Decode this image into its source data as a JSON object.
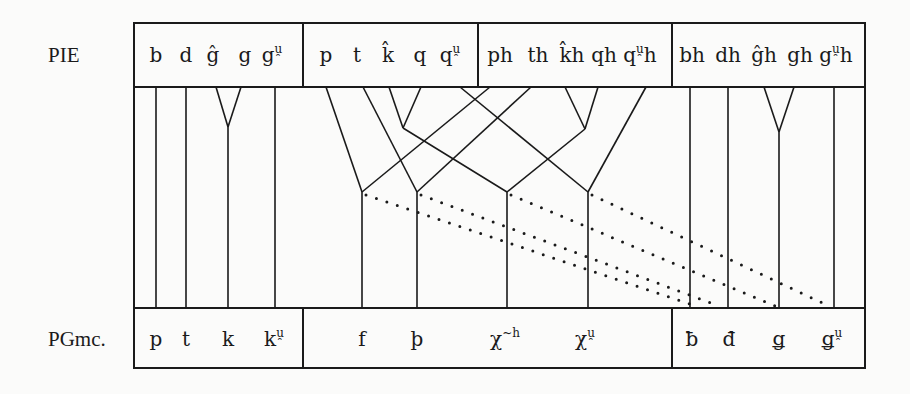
{
  "rows": {
    "top_label": "PIE",
    "bottom_label": "PGmc."
  },
  "pie": {
    "groups": [
      {
        "name": "voiced",
        "items": [
          {
            "base": "b",
            "sup": "",
            "x": 156
          },
          {
            "base": "d",
            "sup": "",
            "x": 186
          },
          {
            "base": "ĝ",
            "sup": "",
            "x": 213
          },
          {
            "base": "g",
            "sup": "",
            "x": 245
          },
          {
            "base": "g",
            "sup": "u̯",
            "x": 272
          }
        ]
      },
      {
        "name": "voiceless",
        "items": [
          {
            "base": "p",
            "sup": "",
            "x": 326
          },
          {
            "base": "t",
            "sup": "",
            "x": 357
          },
          {
            "base": "k̂",
            "sup": "",
            "x": 388
          },
          {
            "base": "q",
            "sup": "",
            "x": 420
          },
          {
            "base": "q",
            "sup": "u̯",
            "x": 450
          }
        ]
      },
      {
        "name": "voiceless-aspirate",
        "items": [
          {
            "base": "ph",
            "sup": "",
            "x": 500
          },
          {
            "base": "th",
            "sup": "",
            "x": 538
          },
          {
            "base": "k̂h",
            "sup": "",
            "x": 572
          },
          {
            "base": "qh",
            "sup": "",
            "x": 604
          },
          {
            "base": "q",
            "sup": "u̯",
            "tail": "h",
            "x": 640
          }
        ]
      },
      {
        "name": "voiced-aspirate",
        "items": [
          {
            "base": "bh",
            "sup": "",
            "x": 692
          },
          {
            "base": "dh",
            "sup": "",
            "x": 728
          },
          {
            "base": "ĝh",
            "sup": "",
            "x": 764
          },
          {
            "base": "gh",
            "sup": "",
            "x": 800
          },
          {
            "base": "g",
            "sup": "u̯",
            "tail": "h",
            "x": 836
          }
        ]
      }
    ]
  },
  "pgmc": {
    "groups": [
      {
        "name": "voiceless-stops",
        "items": [
          {
            "base": "p",
            "sup": "",
            "x": 156
          },
          {
            "base": "t",
            "sup": "",
            "x": 186
          },
          {
            "base": "k",
            "sup": "",
            "x": 228
          },
          {
            "base": "k",
            "sup": "u̯",
            "x": 274
          }
        ]
      },
      {
        "name": "voiceless-fricatives",
        "items": [
          {
            "base": "f",
            "sup": "",
            "x": 362
          },
          {
            "base": "þ",
            "sup": "",
            "x": 417
          },
          {
            "base": "χ",
            "sup": "~h",
            "x": 505
          },
          {
            "base": "χ",
            "sup": "u̯",
            "x": 585
          }
        ]
      },
      {
        "name": "voiced-fricatives",
        "items": [
          {
            "base": "ƀ",
            "sup": "",
            "x": 692
          },
          {
            "base": "đ",
            "sup": "",
            "x": 729
          },
          {
            "base": "ǥ",
            "sup": "",
            "x": 779
          },
          {
            "base": "ǥ",
            "sup": "u̯",
            "x": 832
          }
        ]
      }
    ]
  },
  "layout": {
    "frame": {
      "left": 134,
      "right": 865,
      "top": 23,
      "header_bottom": 87,
      "footer_top": 308,
      "bottom": 368
    },
    "top_dividers": [
      303,
      478,
      672
    ],
    "bottom_dividers": [
      303,
      672
    ]
  },
  "edges": {
    "solid": [
      [
        156,
        87,
        156,
        308
      ],
      [
        186,
        87,
        186,
        308
      ],
      [
        216,
        87,
        228,
        127
      ],
      [
        241,
        87,
        228,
        127
      ],
      [
        228,
        127,
        228,
        308
      ],
      [
        275,
        87,
        275,
        308
      ],
      [
        326,
        87,
        362,
        192
      ],
      [
        490,
        87,
        362,
        192
      ],
      [
        362,
        192,
        362,
        308
      ],
      [
        363,
        87,
        417,
        192
      ],
      [
        531,
        87,
        417,
        192
      ],
      [
        417,
        192,
        417,
        308
      ],
      [
        389,
        87,
        403,
        128
      ],
      [
        421,
        87,
        403,
        128
      ],
      [
        403,
        128,
        507,
        192
      ],
      [
        565,
        87,
        585,
        129
      ],
      [
        598,
        87,
        585,
        129
      ],
      [
        585,
        129,
        507,
        192
      ],
      [
        507,
        192,
        507,
        308
      ],
      [
        460,
        87,
        588,
        192
      ],
      [
        646,
        87,
        588,
        192
      ],
      [
        588,
        192,
        588,
        308
      ],
      [
        690,
        87,
        690,
        308
      ],
      [
        728,
        87,
        728,
        308
      ],
      [
        764,
        87,
        779,
        132
      ],
      [
        794,
        87,
        779,
        132
      ],
      [
        779,
        132,
        779,
        308
      ],
      [
        834,
        87,
        834,
        308
      ]
    ],
    "dotted": [
      [
        366,
        195,
        690,
        304
      ],
      [
        421,
        195,
        719,
        306
      ],
      [
        511,
        195,
        775,
        306
      ],
      [
        592,
        195,
        829,
        306
      ]
    ]
  }
}
